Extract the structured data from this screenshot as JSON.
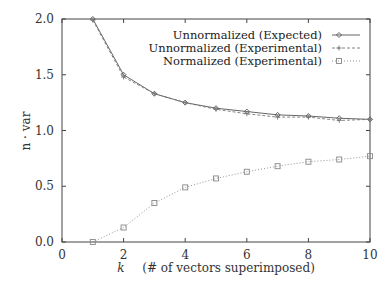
{
  "chart_data": {
    "type": "line",
    "title": "",
    "xlabel": "k    (# of vectors superimposed)",
    "xlabel_var": "k",
    "xlabel_text": "(# of vectors superimposed)",
    "ylabel": "n · var",
    "xlim": [
      0,
      10
    ],
    "ylim": [
      0.0,
      2.0
    ],
    "xticks": [
      "0",
      "2",
      "4",
      "6",
      "8",
      "10"
    ],
    "yticks": [
      "0.0",
      "0.5",
      "1.0",
      "1.5",
      "2.0"
    ],
    "grid": false,
    "legend_position": "upper right",
    "x": [
      1,
      2,
      3,
      4,
      5,
      6,
      7,
      8,
      9,
      10
    ],
    "series": [
      {
        "name": "Unnormalized (Expected)",
        "marker": "diamond",
        "line": "solid",
        "color": "#555555",
        "values": [
          2.0,
          1.5,
          1.33,
          1.25,
          1.2,
          1.17,
          1.14,
          1.13,
          1.11,
          1.1
        ]
      },
      {
        "name": "Unnormalized (Experimental)",
        "marker": "plus",
        "line": "dashed",
        "color": "#777777",
        "values": [
          1.99,
          1.48,
          1.33,
          1.25,
          1.19,
          1.15,
          1.12,
          1.12,
          1.09,
          1.1
        ]
      },
      {
        "name": "Normalized (Experimental)",
        "marker": "square",
        "line": "dotted",
        "color": "#888888",
        "values": [
          0.0,
          0.13,
          0.35,
          0.49,
          0.57,
          0.63,
          0.68,
          0.72,
          0.74,
          0.77
        ]
      }
    ]
  }
}
